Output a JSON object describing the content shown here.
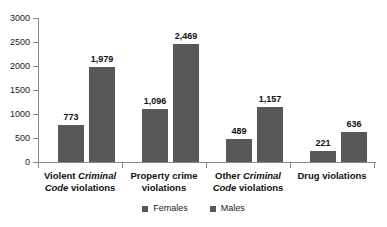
{
  "chart_data": {
    "type": "bar",
    "title": "",
    "xlabel": "",
    "ylabel": "",
    "ylim": [
      0,
      3000
    ],
    "yticks": [
      0,
      500,
      1000,
      1500,
      2000,
      2500,
      3000
    ],
    "ytick_labels": [
      "0",
      "500",
      "1000",
      "1500",
      "2000",
      "2500",
      "3000"
    ],
    "grid": false,
    "legend_position": "bottom",
    "bar_color": "#585858",
    "axis_color": "#8a8a8a",
    "background_color": "#ffffff",
    "categories": [
      {
        "line1_prefix": "Violent ",
        "line1_italic": "Criminal",
        "line2_italic": "Code",
        "line2_suffix": " violations"
      },
      {
        "line1_prefix": "Property crime",
        "line1_italic": "",
        "line2_italic": "",
        "line2_suffix": "violations"
      },
      {
        "line1_prefix": "Other ",
        "line1_italic": "Criminal",
        "line2_italic": "Code",
        "line2_suffix": " violations"
      },
      {
        "line1_prefix": "Drug violations",
        "line1_italic": "",
        "line2_italic": "",
        "line2_suffix": ""
      }
    ],
    "category_names": [
      "Violent Criminal Code violations",
      "Property crime violations",
      "Other Criminal Code violations",
      "Drug violations"
    ],
    "series": [
      {
        "name": "Females",
        "values": [
          773,
          1096,
          489,
          221
        ],
        "value_labels": [
          "773",
          "1,096",
          "489",
          "221"
        ]
      },
      {
        "name": "Males",
        "values": [
          1979,
          2469,
          1157,
          636
        ],
        "value_labels": [
          "1,979",
          "2,469",
          "1,157",
          "636"
        ]
      }
    ],
    "legend": [
      "Females",
      "Males"
    ]
  }
}
